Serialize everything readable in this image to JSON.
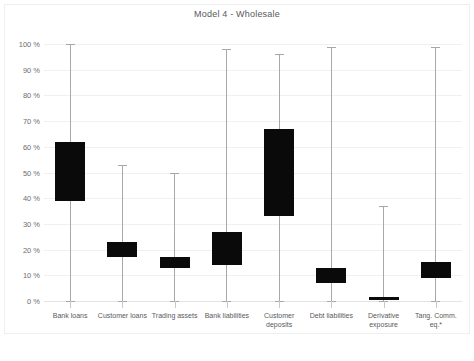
{
  "chart_data": {
    "type": "bar",
    "title": "Model 4 - Wholesale",
    "subtitle": "",
    "xlabel": "",
    "ylabel": "",
    "ylim": [
      0,
      100
    ],
    "yunit": "%",
    "grid": true,
    "legend": null,
    "legend_position": "none",
    "ytick_labels": [
      "100 %",
      "90 %",
      "80 %",
      "70 %",
      "60 %",
      "50 %",
      "40 %",
      "30 %",
      "20 %",
      "10 %",
      "0 %"
    ],
    "ytick_values": [
      100,
      90,
      80,
      70,
      60,
      50,
      40,
      30,
      20,
      10,
      0
    ],
    "categories": [
      "Bank loans",
      "Customer loans",
      "Trading assets",
      "Bank liabilities",
      "Customer\ndeposits",
      "Debt liabilities",
      "Derivative\nexposure",
      "Tang. Comm.\neq.*"
    ],
    "series": [
      {
        "name": "range-box",
        "box_low": [
          39,
          17,
          13,
          14,
          33,
          7,
          0.5,
          9
        ],
        "box_high": [
          62,
          23,
          17,
          27,
          67,
          13,
          1.5,
          15
        ],
        "whisker_low": [
          0,
          0,
          0,
          0,
          0,
          0,
          0,
          0
        ],
        "whisker_high": [
          100,
          53,
          50,
          98,
          96,
          99,
          37,
          99
        ]
      }
    ],
    "colors": {
      "box_fill": "#0a0a0a",
      "whisker": "#a8a8a8",
      "grid": "#f0f0f0",
      "baseline": "#e4e4e4",
      "text": "#59595b",
      "background": "#ffffff",
      "frame": "#efefef"
    },
    "annotations": []
  }
}
